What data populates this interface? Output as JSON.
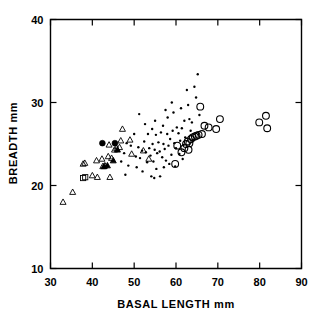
{
  "chart_data": {
    "type": "scatter",
    "title": "",
    "xlabel": "BASAL LENGTH mm",
    "ylabel": "BREADTH mm",
    "xlim": [
      30,
      90
    ],
    "ylim": [
      10,
      40
    ],
    "xticks": [
      30,
      40,
      50,
      60,
      70,
      80,
      90
    ],
    "yticks": [
      10,
      20,
      30,
      40
    ],
    "xtick_labels": [
      "30",
      "40",
      "50",
      "60",
      "70",
      "80",
      "90"
    ],
    "ytick_labels": [
      "10",
      "20",
      "30",
      "40"
    ],
    "grid": false,
    "legend": null,
    "series": [
      {
        "name": "open-triangle",
        "marker": "triangle-open",
        "points": [
          [
            33.0,
            18.0
          ],
          [
            35.3,
            19.2
          ],
          [
            37.8,
            22.6
          ],
          [
            38.2,
            22.7
          ],
          [
            40.0,
            21.2
          ],
          [
            41.2,
            21.0
          ],
          [
            41.0,
            23.0
          ],
          [
            42.3,
            23.2
          ],
          [
            43.0,
            22.4
          ],
          [
            43.8,
            23.5
          ],
          [
            44.6,
            23.3
          ],
          [
            45.3,
            24.3
          ],
          [
            45.8,
            24.5
          ],
          [
            46.5,
            24.6
          ],
          [
            47.2,
            26.8
          ],
          [
            46.8,
            25.4
          ],
          [
            44.0,
            24.9
          ],
          [
            42.5,
            22.3
          ],
          [
            49.0,
            25.5
          ],
          [
            49.4,
            23.8
          ],
          [
            53.5,
            23.2
          ],
          [
            52.2,
            24.2
          ],
          [
            44.2,
            21.0
          ]
        ]
      },
      {
        "name": "filled-triangle",
        "marker": "triangle-filled",
        "points": [
          [
            42.8,
            22.3
          ],
          [
            45.0,
            23.0
          ],
          [
            46.0,
            24.3
          ],
          [
            43.6,
            22.4
          ]
        ]
      },
      {
        "name": "open-square",
        "marker": "square-open",
        "points": [
          [
            37.8,
            20.9
          ],
          [
            38.3,
            21.0
          ]
        ]
      },
      {
        "name": "filled-circle",
        "marker": "circle-filled",
        "points": [
          [
            42.4,
            25.1
          ],
          [
            45.4,
            25.1
          ]
        ]
      },
      {
        "name": "small-dot",
        "marker": "dot",
        "points": [
          [
            47.9,
            21.3
          ],
          [
            48.6,
            22.4
          ],
          [
            50.4,
            23.5
          ],
          [
            51.0,
            24.6
          ],
          [
            51.4,
            23.3
          ],
          [
            51.9,
            24.2
          ],
          [
            52.4,
            25.3
          ],
          [
            52.8,
            24.0
          ],
          [
            53.1,
            22.8
          ],
          [
            53.6,
            24.5
          ],
          [
            53.9,
            23.6
          ],
          [
            54.1,
            21.1
          ],
          [
            54.4,
            25.0
          ],
          [
            54.6,
            22.9
          ],
          [
            54.9,
            24.3
          ],
          [
            55.2,
            26.1
          ],
          [
            55.5,
            23.9
          ],
          [
            55.8,
            25.2
          ],
          [
            56.1,
            24.1
          ],
          [
            56.4,
            26.4
          ],
          [
            56.7,
            23.4
          ],
          [
            57.0,
            25.0
          ],
          [
            57.3,
            24.4
          ],
          [
            57.6,
            23.0
          ],
          [
            51.2,
            28.6
          ],
          [
            52.6,
            27.4
          ],
          [
            54.3,
            26.8
          ],
          [
            55.0,
            27.8
          ],
          [
            56.9,
            27.2
          ],
          [
            57.9,
            26.2
          ],
          [
            58.2,
            24.8
          ],
          [
            58.6,
            25.6
          ],
          [
            58.9,
            23.7
          ],
          [
            59.2,
            26.6
          ],
          [
            59.6,
            25.1
          ],
          [
            60.0,
            24.5
          ],
          [
            58.0,
            28.2
          ],
          [
            59.0,
            30.0
          ],
          [
            60.2,
            27.0
          ],
          [
            60.6,
            26.3
          ],
          [
            61.0,
            25.4
          ],
          [
            61.4,
            26.9
          ],
          [
            61.8,
            24.9
          ],
          [
            62.2,
            25.8
          ],
          [
            62.6,
            31.5
          ],
          [
            62.9,
            29.7
          ],
          [
            63.2,
            28.0
          ],
          [
            63.5,
            26.6
          ],
          [
            64.0,
            25.5
          ],
          [
            64.4,
            31.9
          ],
          [
            64.8,
            30.6
          ],
          [
            65.2,
            33.4
          ],
          [
            65.6,
            28.5
          ],
          [
            50.0,
            26.2
          ],
          [
            49.2,
            24.8
          ],
          [
            53.3,
            26.2
          ],
          [
            47.6,
            23.9
          ],
          [
            48.2,
            25.1
          ],
          [
            56.2,
            21.1
          ],
          [
            57.1,
            22.2
          ],
          [
            55.3,
            22.0
          ],
          [
            58.4,
            22.6
          ],
          [
            60.8,
            23.8
          ],
          [
            61.6,
            23.2
          ],
          [
            52.0,
            21.7
          ],
          [
            50.6,
            22.2
          ],
          [
            63.8,
            27.6
          ],
          [
            62.0,
            27.8
          ],
          [
            59.4,
            28.8
          ],
          [
            57.5,
            29.1
          ],
          [
            61.2,
            29.3
          ],
          [
            46.9,
            22.9
          ],
          [
            59.8,
            22.3
          ],
          [
            54.8,
            20.9
          ]
        ]
      },
      {
        "name": "open-circle",
        "marker": "circle-open",
        "points": [
          [
            59.8,
            22.6
          ],
          [
            61.3,
            24.0
          ],
          [
            62.0,
            24.5
          ],
          [
            62.4,
            25.0
          ],
          [
            62.8,
            25.3
          ],
          [
            63.2,
            25.1
          ],
          [
            63.6,
            25.6
          ],
          [
            64.0,
            25.8
          ],
          [
            64.5,
            25.9
          ],
          [
            64.9,
            26.0
          ],
          [
            65.4,
            26.1
          ],
          [
            63.0,
            24.3
          ],
          [
            65.8,
            29.5
          ],
          [
            66.8,
            27.2
          ],
          [
            67.8,
            27.0
          ],
          [
            69.6,
            26.8
          ],
          [
            70.5,
            28.0
          ],
          [
            79.9,
            27.6
          ],
          [
            81.5,
            28.4
          ],
          [
            81.8,
            26.9
          ],
          [
            60.3,
            24.8
          ],
          [
            66.2,
            26.2
          ]
        ]
      }
    ]
  }
}
